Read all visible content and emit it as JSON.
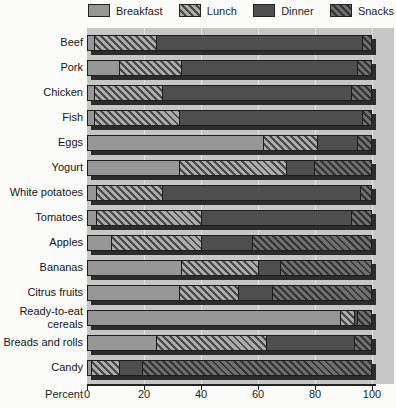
{
  "legend": {
    "note": "legend labels mirror chart series names"
  },
  "axis": {
    "xlabel": "Percent"
  },
  "chart_data": {
    "type": "bar",
    "stacked": true,
    "orientation": "horizontal",
    "title": "",
    "xlabel": "Percent",
    "ylabel": "",
    "xlim": [
      0,
      100
    ],
    "xticks": [
      0,
      20,
      40,
      60,
      80,
      100
    ],
    "grid": "vertical-light",
    "legend_position": "top",
    "plot_bg_color": "#c6c6c6",
    "bar_shadow_color": "#2c2c2c",
    "categories": [
      "Beef",
      "Pork",
      "Chicken",
      "Fish",
      "Eggs",
      "Yogurt",
      "White potatoes",
      "Tomatoes",
      "Apples",
      "Bananas",
      "Citrus fruits",
      "Ready-to-eat cereals",
      "Breads and rolls",
      "Candy"
    ],
    "series": [
      {
        "name": "Breakfast",
        "pattern": "solid",
        "base_color": "#969696",
        "stripe_color": null,
        "values": [
          2,
          11,
          2,
          2,
          62,
          32,
          3,
          3,
          8,
          33,
          32,
          89,
          24,
          1
        ]
      },
      {
        "name": "Lunch",
        "pattern": "hatch",
        "base_color": "#ababab",
        "stripe_color": "#4a4a4a",
        "values": [
          22,
          22,
          24,
          30,
          19,
          38,
          23,
          37,
          32,
          27,
          21,
          5,
          39,
          10
        ]
      },
      {
        "name": "Dinner",
        "pattern": "solid",
        "base_color": "#4e4e4e",
        "stripe_color": null,
        "values": [
          73,
          62,
          67,
          65,
          14,
          10,
          70,
          53,
          18,
          8,
          12,
          1,
          31,
          8
        ]
      },
      {
        "name": "Snacks",
        "pattern": "hatch",
        "base_color": "#6e6e6e",
        "stripe_color": "#343434",
        "values": [
          3,
          5,
          7,
          3,
          5,
          20,
          4,
          7,
          42,
          32,
          35,
          5,
          6,
          81
        ]
      }
    ]
  }
}
